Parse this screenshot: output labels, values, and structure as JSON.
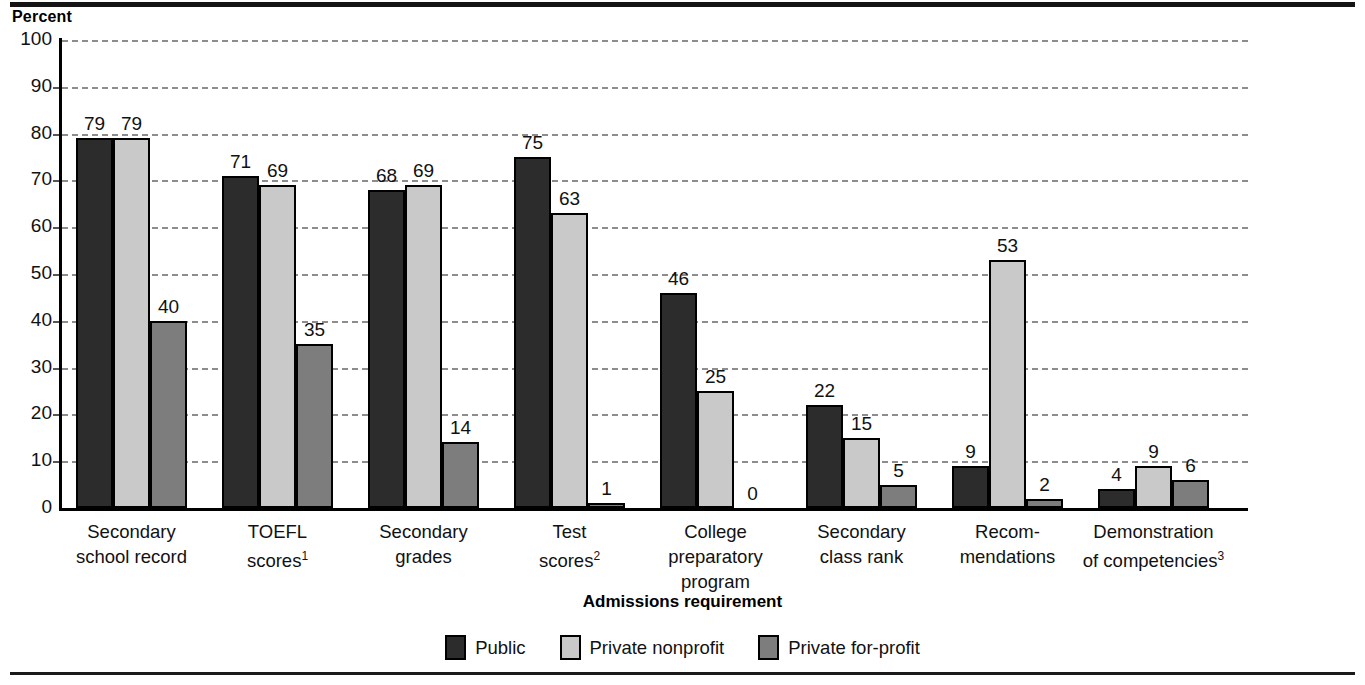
{
  "header": {
    "percent_label": "Percent"
  },
  "chart_data": {
    "type": "bar",
    "title": "",
    "xlabel": "Admissions requirement",
    "ylabel": "Percent",
    "ylim": [
      0,
      100
    ],
    "ytick_step": 10,
    "grid": true,
    "legend_position": "bottom",
    "categories": [
      "Secondary school record",
      "TOEFL scores",
      "Secondary grades",
      "Test scores",
      "College preparatory program",
      "Secondary class rank",
      "Recommendations",
      "Demonstration of competencies"
    ],
    "category_lines": [
      [
        "Secondary",
        "school record"
      ],
      [
        "TOEFL",
        "scores"
      ],
      [
        "Secondary",
        "grades"
      ],
      [
        "Test",
        "scores"
      ],
      [
        "College",
        "preparatory",
        "program"
      ],
      [
        "Secondary",
        "class rank"
      ],
      [
        "Recom-",
        "mendations"
      ],
      [
        "Demonstration",
        "of competencies"
      ]
    ],
    "category_footnotes": [
      "",
      "1",
      "",
      "2",
      "",
      "",
      "",
      "3"
    ],
    "yticks": [
      "0",
      "10",
      "20",
      "30",
      "40",
      "50",
      "60",
      "70",
      "80",
      "90",
      "100"
    ],
    "series": [
      {
        "name": "Public",
        "color": "#2c2c2c",
        "values": [
          79,
          71,
          68,
          75,
          46,
          22,
          9,
          4
        ]
      },
      {
        "name": "Private nonprofit",
        "color": "#c9c9c9",
        "values": [
          79,
          69,
          69,
          63,
          25,
          15,
          53,
          9
        ]
      },
      {
        "name": "Private for-profit",
        "color": "#7d7d7d",
        "values": [
          40,
          35,
          14,
          1,
          0,
          5,
          2,
          6
        ]
      }
    ]
  }
}
